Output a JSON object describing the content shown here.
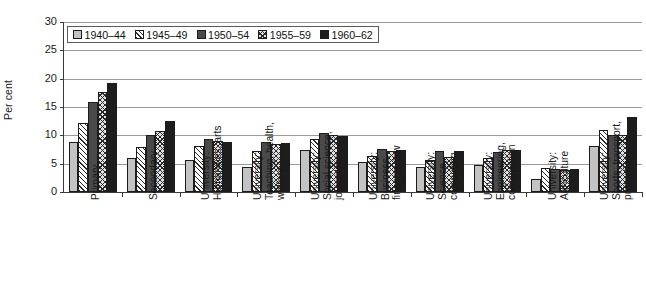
{
  "chart_data": {
    "type": "bar",
    "title": "",
    "subtitle": "",
    "xlabel": "",
    "ylabel": "Per cent",
    "ylim": [
      0,
      30
    ],
    "yticks": [
      0,
      5,
      10,
      15,
      20,
      25,
      30
    ],
    "ytick_labels": [
      "0",
      "5",
      "10",
      "15",
      "20",
      "25",
      "30"
    ],
    "grid": true,
    "legend_position": "top-left-inside",
    "categories": [
      "Primary",
      "Secondary",
      "University:\nHumanities, arts",
      "University:\nTeaching, health,\nwelfare",
      "University:\nSocial science,\njournalism",
      "University:\nBusiness,\nfinance, law",
      "University:\nScience,\ncomputing",
      "University:\nEngineering,\nconstruction",
      "University:\nAgriculture",
      "University:\nSports, transport,\nprotection"
    ],
    "category_lines": [
      [
        "Primary"
      ],
      [
        "Secondary"
      ],
      [
        "University:",
        "Humanities, arts"
      ],
      [
        "University:",
        "Teaching, health,",
        "welfare"
      ],
      [
        "University:",
        "Social science,",
        "journalism"
      ],
      [
        "University:",
        "Business,",
        "finance, law"
      ],
      [
        "University:",
        "Science,",
        "computing"
      ],
      [
        "University:",
        "Engineering,",
        "construction"
      ],
      [
        "University:",
        "Agriculture"
      ],
      [
        "University:",
        "Sports, transport,",
        "protection"
      ]
    ],
    "series": [
      {
        "name": "1940–44",
        "fill": "solid-light-gray",
        "color": "#c3c3c3",
        "values": [
          8.8,
          6.0,
          5.7,
          4.5,
          7.5,
          5.3,
          4.5,
          4.7,
          2.3,
          8.2
        ]
      },
      {
        "name": "1945–49",
        "fill": "diagonal-hatch",
        "color": "#ffffff",
        "values": [
          12.2,
          8.0,
          8.2,
          7.3,
          9.3,
          6.3,
          5.6,
          6.0,
          4.2,
          11.0
        ]
      },
      {
        "name": "1950–54",
        "fill": "solid-dark-gray",
        "color": "#4a4a4a",
        "values": [
          15.8,
          10.0,
          9.3,
          8.8,
          10.5,
          7.6,
          7.2,
          7.0,
          4.0,
          10.0
        ]
      },
      {
        "name": "1955–59",
        "fill": "cross-hatch",
        "color": "#e2e2e2",
        "values": [
          17.6,
          10.7,
          9.0,
          8.5,
          10.0,
          7.3,
          6.2,
          7.4,
          3.9,
          10.0
        ]
      },
      {
        "name": "1960–62",
        "fill": "solid-black",
        "color": "#1d1d1d",
        "values": [
          19.3,
          12.5,
          8.8,
          8.7,
          9.8,
          7.4,
          7.3,
          7.5,
          4.0,
          13.3
        ]
      }
    ]
  }
}
